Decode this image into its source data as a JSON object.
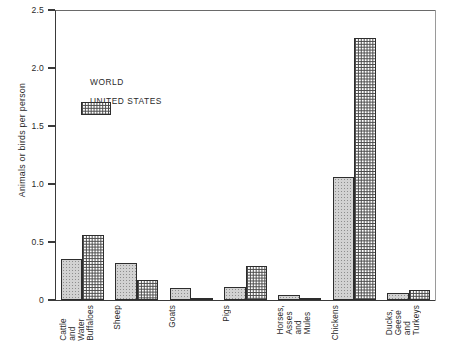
{
  "chart_data": {
    "type": "bar",
    "title": "",
    "xlabel": "",
    "ylabel": "Animals or birds per person",
    "ylim": [
      0,
      2.5
    ],
    "yticks": [
      "0",
      "0.5",
      "1.0",
      "1.5",
      "2.0",
      "2.5"
    ],
    "ytick_values": [
      0,
      0.5,
      1.0,
      1.5,
      2.0,
      2.5
    ],
    "grid": false,
    "legend_position": "upper-left-inside",
    "categories": [
      "Cattle and Water Buffaloes",
      "Sheep",
      "Goats",
      "Pigs",
      "Horses, Asses and Mules",
      "Chickens",
      "Ducks, Geese and Turkeys"
    ],
    "category_label_lines": [
      [
        "Cattle",
        "and",
        "Water",
        "Buffaloes"
      ],
      [
        "Sheep"
      ],
      [
        "Goats"
      ],
      [
        "Pigs"
      ],
      [
        "Horses,",
        "Asses",
        "and",
        "Mules"
      ],
      [
        "Chickens"
      ],
      [
        "Ducks,",
        "Geese",
        "and",
        "Turkeys"
      ]
    ],
    "series": [
      {
        "name": "WORLD",
        "fill": "light-stipple",
        "values": [
          0.35,
          0.32,
          0.1,
          0.11,
          0.04,
          1.06,
          0.06
        ]
      },
      {
        "name": "UNITED STATES",
        "fill": "dense-checker",
        "values": [
          0.56,
          0.17,
          0.01,
          0.29,
          0.02,
          2.26,
          0.09
        ]
      }
    ]
  },
  "legend": {
    "items": [
      {
        "label": "WORLD",
        "swatch": "light-stipple-swatch"
      },
      {
        "label": "UNITED STATES",
        "swatch": "dense-checker-swatch"
      }
    ]
  },
  "colors": {
    "axis": "#3a3a3a",
    "text": "#2a2a2a",
    "world_fill": "#d2d2d2",
    "us_fill": "#ffffff",
    "bar_border": "#2d2d2d",
    "background": "#ffffff"
  }
}
